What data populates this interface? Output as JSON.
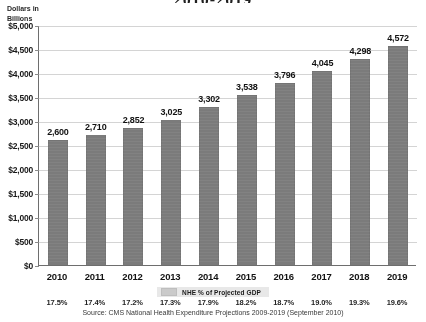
{
  "chart_data": {
    "type": "bar",
    "title": "2010-2019",
    "subtitle": "",
    "xlabel": "",
    "ylabel": "Dollars in Billions",
    "ylabel_line1": "Dollars in",
    "ylabel_line2": "Billions",
    "ylim": [
      0,
      5000
    ],
    "ytick_step": 500,
    "grid": true,
    "legend_position": "below-axis",
    "categories": [
      "2010",
      "2011",
      "2012",
      "2013",
      "2014",
      "2015",
      "2016",
      "2017",
      "2018",
      "2019"
    ],
    "values": [
      2600,
      2710,
      2852,
      3025,
      3302,
      3538,
      3796,
      4045,
      4298,
      4572
    ],
    "value_labels": [
      "2,600",
      "2,710",
      "2,852",
      "3,025",
      "3,302",
      "3,538",
      "3,796",
      "4,045",
      "4,298",
      "4,572"
    ],
    "ytick_labels": [
      "$5,000",
      "$4,500",
      "$4,000",
      "$3,500",
      "$3,000",
      "$2,500",
      "$2,000",
      "$1,500",
      "$1,000",
      "$500",
      "$0"
    ],
    "ytick_values": [
      5000,
      4500,
      4000,
      3500,
      3000,
      2500,
      2000,
      1500,
      1000,
      500,
      0
    ],
    "legend": [
      "NHE % of Projected GDP"
    ],
    "secondary_series": {
      "name": "NHE % of Projected GDP",
      "value_labels": [
        "17.5%",
        "17.4%",
        "17.2%",
        "17.3%",
        "17.9%",
        "18.2%",
        "18.7%",
        "19.0%",
        "19.3%",
        "19.6%"
      ],
      "values": [
        17.5,
        17.4,
        17.2,
        17.3,
        17.9,
        18.2,
        18.7,
        19.0,
        19.3,
        19.6
      ]
    },
    "annotations": [
      "Source: CMS National Health Expenditure Projections 2009-2019 (September 2010)"
    ],
    "bar_color": "#7b7b7b",
    "grid_color": "#d2d2d2",
    "axis_color": "#6e6e6e"
  },
  "source_note": "Source: CMS National Health Expenditure Projections 2009-2019 (September 2010)"
}
